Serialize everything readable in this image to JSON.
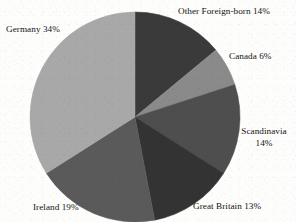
{
  "chart_data": {
    "type": "pie",
    "title": "",
    "subtitle": "",
    "xlabel": "",
    "ylabel": "",
    "legend_position": "none",
    "labels_outside": true,
    "start_angle_deg": 0,
    "direction": "clockwise",
    "background_color": "#fdfdfb",
    "categories": [
      "Other Foreign-born",
      "Canada",
      "Scandinavia",
      "Great Britain",
      "Ireland",
      "Germany"
    ],
    "values": [
      14,
      6,
      14,
      13,
      19,
      34
    ],
    "unit": "%",
    "colors": [
      "#3a3a3a",
      "#8a8a8a",
      "#4e4e4e",
      "#333333",
      "#5a5a5a",
      "#a8a8a8"
    ],
    "slices": [
      {
        "name": "Other Foreign-born",
        "value": 14,
        "label": "Other Foreign-born 14%",
        "color": "#3a3a3a"
      },
      {
        "name": "Canada",
        "value": 6,
        "label": "Canada 6%",
        "color": "#8a8a8a"
      },
      {
        "name": "Scandinavia",
        "value": 14,
        "label_line1": "Scandinavia",
        "label_line2": "14%",
        "color": "#4e4e4e"
      },
      {
        "name": "Great Britain",
        "value": 13,
        "label": "Great Britain 13%",
        "color": "#333333"
      },
      {
        "name": "Ireland",
        "value": 19,
        "label": "Ireland 19%",
        "color": "#5a5a5a"
      },
      {
        "name": "Germany",
        "value": 34,
        "label": "Germany 34%",
        "color": "#a8a8a8"
      }
    ]
  },
  "geometry": {
    "center_x": 135,
    "center_y": 117,
    "radius": 105
  }
}
